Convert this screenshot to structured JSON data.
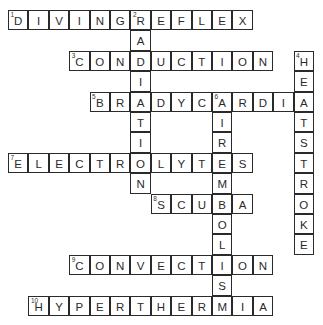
{
  "puzzle": {
    "type": "crossword",
    "rows": 15,
    "cols": 15,
    "cell_size_px": 20.4,
    "words": [
      {
        "number": 1,
        "answer": "DIVINGREFLEX",
        "row": 0,
        "col": 0,
        "direction": "across"
      },
      {
        "number": 2,
        "answer": "RADIATION",
        "row": 0,
        "col": 6,
        "direction": "down"
      },
      {
        "number": 3,
        "answer": "CONDUCTION",
        "row": 2,
        "col": 3,
        "direction": "across"
      },
      {
        "number": 4,
        "answer": "HEATSTROKE",
        "row": 2,
        "col": 14,
        "direction": "down"
      },
      {
        "number": 5,
        "answer": "BRADYCARDIA",
        "row": 4,
        "col": 4,
        "direction": "across"
      },
      {
        "number": 6,
        "answer": "AIREMBOLISM",
        "row": 4,
        "col": 10,
        "direction": "down"
      },
      {
        "number": 7,
        "answer": "ELECTROLYTES",
        "row": 7,
        "col": 0,
        "direction": "across"
      },
      {
        "number": 8,
        "answer": "SCUBA",
        "row": 9,
        "col": 7,
        "direction": "across"
      },
      {
        "number": 9,
        "answer": "CONVECTION",
        "row": 12,
        "col": 3,
        "direction": "across"
      },
      {
        "number": 10,
        "answer": "HYPERTHERMIA",
        "row": 14,
        "col": 1,
        "direction": "across"
      }
    ]
  },
  "colors": {
    "border": "#2a2a2a",
    "letter": "#2a2a2a",
    "background": "#ffffff"
  }
}
